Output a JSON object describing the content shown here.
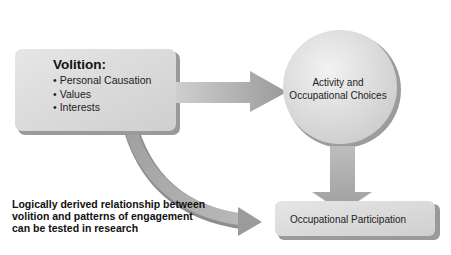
{
  "diagram": {
    "volition": {
      "title": "Volition:",
      "items": [
        "Personal Causation",
        "Values",
        "Interests"
      ]
    },
    "activity_choices": {
      "line1": "Activity and",
      "line2": "Occupational Choices"
    },
    "occupational_participation": {
      "label": "Occupational Participation"
    },
    "note": {
      "text": "Logically derived relationship between volition and patterns of engagement can be tested in research"
    },
    "arrows": [
      {
        "from": "volition",
        "to": "activity_choices",
        "direction": "right"
      },
      {
        "from": "activity_choices",
        "to": "occupational_participation",
        "direction": "down"
      },
      {
        "from": "volition",
        "to": "occupational_participation",
        "direction": "bidirectional-curved"
      }
    ],
    "colors": {
      "box_fill": "#d8d8d8",
      "arrow_fill": "#a8a8a8",
      "shadow": "#8a8a8a",
      "text": "#111111"
    }
  }
}
